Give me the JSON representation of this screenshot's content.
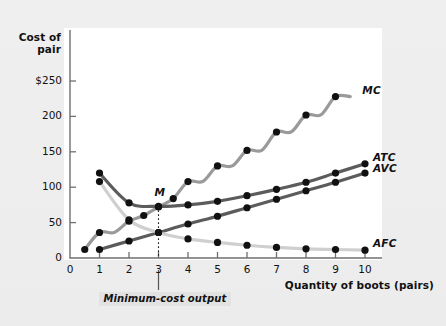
{
  "chart_data": {
    "type": "line",
    "title": "",
    "xlabel": "Quantity of boots (pairs)",
    "ylabel": "Cost of pair",
    "xlim": [
      0,
      10.6
    ],
    "ylim": [
      0,
      272
    ],
    "grid": false,
    "legend_position": "right-of-curve-ends",
    "x_ticks": [
      "0",
      "1",
      "2",
      "3",
      "4",
      "5",
      "6",
      "7",
      "8",
      "9",
      "10"
    ],
    "x_tick_values": [
      0,
      1,
      2,
      3,
      4,
      5,
      6,
      7,
      8,
      9,
      10
    ],
    "y_ticks": [
      "0",
      "50",
      "100",
      "150",
      "200",
      "$250"
    ],
    "y_tick_values": [
      0,
      50,
      100,
      150,
      200,
      250
    ],
    "series": [
      {
        "name": "MC",
        "label": "MC",
        "color": "#9a9a9a",
        "marker": "filled-circle",
        "x": [
          0.5,
          1.0,
          1.5,
          2.0,
          2.5,
          3.0,
          3.5,
          4.0,
          4.5,
          5.0,
          5.5,
          6.0,
          6.5,
          7.0,
          7.5,
          8.0,
          8.5,
          9.0,
          9.5
        ],
        "values": [
          12,
          36,
          36,
          52,
          60,
          72,
          84,
          108,
          108,
          130,
          130,
          152,
          152,
          178,
          178,
          202,
          202,
          228,
          228
        ]
      },
      {
        "name": "ATC",
        "label": "ATC",
        "color": "#5c5c5c",
        "marker": "filled-circle",
        "x": [
          1,
          2,
          3,
          4,
          5,
          6,
          7,
          8,
          9,
          10
        ],
        "values": [
          120,
          78,
          73,
          75,
          80,
          88,
          97,
          107,
          120,
          133
        ]
      },
      {
        "name": "AVC",
        "label": "AVC",
        "color": "#5c5c5c",
        "marker": "filled-circle",
        "x": [
          1,
          2,
          3,
          4,
          5,
          6,
          7,
          8,
          9,
          10
        ],
        "values": [
          12,
          24,
          36,
          48,
          59,
          71,
          83,
          95,
          107,
          120
        ]
      },
      {
        "name": "AFC",
        "label": "AFC",
        "color": "#cfcfcf",
        "marker": "filled-circle",
        "x": [
          1,
          2,
          3,
          4,
          5,
          6,
          7,
          8,
          9,
          10
        ],
        "values": [
          108,
          54,
          36,
          27,
          22,
          18,
          15,
          13,
          12,
          11
        ]
      }
    ],
    "annotations": [
      {
        "name": "minimum-cost-point",
        "text": "M",
        "x": 3,
        "y": 73
      },
      {
        "name": "minimum-cost-output",
        "text": "Minimum-cost output",
        "x": 3
      }
    ]
  },
  "axis": {
    "y_title_line1": "Cost of",
    "y_title_line2": "pair",
    "x_title": "Quantity of boots (pairs)"
  },
  "colors": {
    "mc": "#9a9a9a",
    "atc": "#5c5c5c",
    "avc": "#5c5c5c",
    "afc": "#cfcfcf",
    "axis": "#6f6f6f",
    "marker": "#111111",
    "page_background": "#eeeeee",
    "plot_background": "#ffffff",
    "annotation_background": "#e2e2e2"
  }
}
